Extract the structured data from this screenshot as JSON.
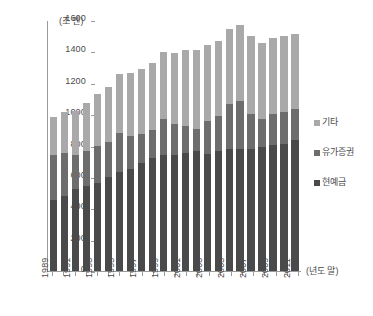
{
  "chart_data": {
    "type": "bar",
    "stacked": true,
    "title": "",
    "subtitle": "",
    "unit_label": "(조 엔)",
    "xlabel": "(년도 말)",
    "ylabel": "",
    "ylim": [
      0,
      1600
    ],
    "ytick_values": [
      0,
      200,
      400,
      600,
      800,
      1000,
      1200,
      1400,
      1600
    ],
    "ytick_labels": [
      "0",
      "200",
      "400",
      "600",
      "800",
      "1000",
      "1200",
      "1400",
      "1600"
    ],
    "grid": false,
    "legend_position": "right",
    "categories": [
      "1989",
      "1990",
      "1991",
      "1992",
      "1993",
      "1994",
      "1995",
      "1996",
      "1997",
      "1998",
      "1999",
      "2000",
      "2001",
      "2002",
      "2003",
      "2004",
      "2005",
      "2006",
      "2007",
      "2008",
      "2009",
      "2010",
      "2011"
    ],
    "xtick_labels_shown": [
      "1989",
      "1991",
      "1993",
      "1995",
      "1997",
      "1999",
      "2001",
      "2003",
      "2005",
      "2007",
      "2009",
      "2011"
    ],
    "series": [
      {
        "name": "현예금",
        "color": "#4a4a4a",
        "values": [
          450,
          478,
          520,
          545,
          560,
          598,
          633,
          652,
          690,
          720,
          742,
          740,
          750,
          765,
          748,
          762,
          775,
          778,
          780,
          790,
          805,
          812,
          838
        ]
      },
      {
        "name": "유가증권",
        "color": "#6d6d6d",
        "values": [
          288,
          272,
          218,
          222,
          235,
          222,
          245,
          210,
          182,
          180,
          228,
          200,
          172,
          138,
          208,
          228,
          290,
          305,
          222,
          178,
          198,
          203,
          192
        ]
      },
      {
        "name": "기타",
        "color": "#a9a9a9",
        "values": [
          242,
          265,
          285,
          305,
          335,
          355,
          380,
          398,
          415,
          428,
          428,
          448,
          488,
          505,
          488,
          478,
          480,
          487,
          495,
          485,
          485,
          483,
          482
        ]
      }
    ],
    "totals": [
      980,
      1015,
      1023,
      1072,
      1130,
      1175,
      1258,
      1260,
      1287,
      1328,
      1398,
      1388,
      1410,
      1408,
      1444,
      1468,
      1545,
      1570,
      1497,
      1453,
      1488,
      1498,
      1512
    ]
  },
  "legend": {
    "items": [
      {
        "label": "기타",
        "color": "#a9a9a9",
        "swatch_name": "legend-swatch-other"
      },
      {
        "label": "유가증권",
        "color": "#6d6d6d",
        "swatch_name": "legend-swatch-securities"
      },
      {
        "label": "현예금",
        "color": "#4a4a4a",
        "swatch_name": "legend-swatch-cash"
      }
    ]
  }
}
